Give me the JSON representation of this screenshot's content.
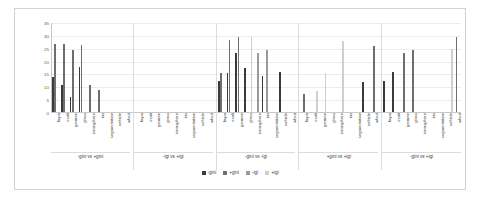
{
  "chart_data": {
    "type": "bar",
    "title": "",
    "subtitle": "",
    "xlabel": "",
    "ylabel": "",
    "ylim": [
      0,
      35
    ],
    "yticks": [
      0,
      5,
      10,
      15,
      20,
      25,
      30,
      35
    ],
    "grid": true,
    "legend_position": "bottom",
    "legend": [
      "-gini",
      "+gini",
      "-igi",
      "+igi"
    ],
    "colors": {
      "-gini": "#3a3a3a",
      "+gini": "#6e6e6e",
      "-igi": "#9a9a9a",
      "+igi": "#cfcfcf"
    },
    "group_labels": [
      "-gini vs +gini",
      "-igi vs +igi",
      "-gini vs -igi",
      "+gini vs +igi",
      "-gini vs +igi"
    ],
    "datasets": [
      "bupa",
      "ecoli",
      "german",
      "glass",
      "ionosphere",
      "iris",
      "segmentation",
      "vehicle",
      "wbcd"
    ],
    "categories": [
      "bupa",
      "ecoli",
      "german",
      "glass",
      "ionosphere",
      "iris",
      "segmentation",
      "vehicle",
      "wbcd",
      "bupa",
      "ecoli",
      "german",
      "glass",
      "ionosphere",
      "iris",
      "segmentation",
      "vehicle",
      "wbcd",
      "bupa",
      "ecoli",
      "german",
      "glass",
      "ionosphere",
      "iris",
      "segmentation",
      "vehicle",
      "wbcd",
      "bupa",
      "ecoli",
      "german",
      "glass",
      "ionosphere",
      "iris",
      "segmentation",
      "vehicle",
      "wbcd",
      "bupa",
      "ecoli",
      "german",
      "glass",
      "ionosphere",
      "iris",
      "segmentation",
      "vehicle",
      "wbcd"
    ],
    "series": [
      {
        "name": "-gini",
        "values": [
          13.5,
          10.5,
          6.0,
          17.5,
          0,
          0,
          0,
          0,
          0,
          0,
          0,
          0,
          0,
          0,
          0,
          0,
          0,
          0,
          12.0,
          15.0,
          23.0,
          17.0,
          0,
          14.0,
          0,
          15.5,
          0,
          0,
          0,
          0,
          0,
          0,
          0,
          0,
          11.5,
          0,
          12.0,
          15.5,
          0,
          0,
          0,
          0,
          0,
          0,
          0
        ]
      },
      {
        "name": "+gini",
        "values": [
          26.5,
          26.5,
          24.0,
          26.0,
          10.5,
          8.5,
          0,
          0,
          0,
          0,
          0,
          0,
          0,
          0,
          0,
          0,
          0,
          0,
          15.0,
          28.0,
          29.0,
          0,
          0,
          0,
          0,
          0,
          0,
          7.0,
          0,
          0,
          0,
          0,
          0,
          0,
          0,
          25.5,
          0,
          0,
          23.0,
          24.0,
          0,
          0,
          0,
          0,
          29.0
        ]
      },
      {
        "name": "-igi",
        "values": [
          0,
          0,
          0,
          0,
          0,
          0,
          0,
          0,
          0,
          0,
          0,
          0,
          0,
          0,
          0,
          0,
          0,
          0,
          0,
          0,
          0,
          0,
          23.0,
          24.0,
          0,
          0,
          0,
          0,
          0,
          0,
          0,
          0,
          0,
          0,
          0,
          0,
          0,
          0,
          0,
          0,
          0,
          0,
          0,
          0,
          0
        ]
      },
      {
        "name": "+igi",
        "values": [
          0,
          0,
          0,
          0,
          0,
          0,
          0,
          0,
          0,
          0,
          0,
          0,
          0,
          0,
          0,
          0,
          0,
          0,
          0,
          0,
          0,
          29.0,
          0,
          0,
          0,
          0,
          0,
          0,
          8.0,
          15.0,
          0,
          27.5,
          0,
          0,
          0,
          0,
          0,
          0,
          0,
          0,
          0,
          0,
          0,
          24.5,
          0
        ]
      }
    ],
    "bars": [
      {
        "group": 0,
        "dataset": "bupa",
        "series": "-gini",
        "value": 13.5
      },
      {
        "group": 0,
        "dataset": "bupa",
        "series": "+gini",
        "value": 26.5
      },
      {
        "group": 0,
        "dataset": "ecoli",
        "series": "-gini",
        "value": 10.5
      },
      {
        "group": 0,
        "dataset": "ecoli",
        "series": "+gini",
        "value": 26.5
      },
      {
        "group": 0,
        "dataset": "german",
        "series": "-gini",
        "value": 6.0
      },
      {
        "group": 0,
        "dataset": "german",
        "series": "+gini",
        "value": 24.0
      },
      {
        "group": 0,
        "dataset": "glass",
        "series": "-gini",
        "value": 17.5
      },
      {
        "group": 0,
        "dataset": "glass",
        "series": "+gini",
        "value": 26.0
      },
      {
        "group": 0,
        "dataset": "ionosphere",
        "series": "-igi",
        "value": 10.5
      },
      {
        "group": 0,
        "dataset": "iris",
        "series": "-igi",
        "value": 8.5
      },
      {
        "group": 0,
        "dataset": "segmentation",
        "series": "+gini",
        "value": 15.0
      },
      {
        "group": 0,
        "dataset": "vehicle",
        "series": "-gini",
        "value": 12.0
      },
      {
        "group": 0,
        "dataset": "wbcd",
        "series": "+gini",
        "value": 28.0
      }
    ],
    "bar_values_ordered": [
      26.5,
      13.5,
      26.5,
      10.5,
      24.0,
      6.0,
      26.0,
      17.5,
      10.5,
      8.5,
      15.0,
      12.0,
      28.0,
      15.0,
      29.0,
      23.0,
      17.0,
      29.0,
      23.0,
      14.0,
      24.0,
      15.5,
      7.0,
      8.0,
      15.0,
      6.0,
      15.0,
      27.5,
      11.5,
      25.5,
      12.0,
      23.0,
      15.5,
      24.0,
      12.0,
      24.5,
      29.0
    ]
  },
  "axis": {
    "y_max_label": "35",
    "y_min_label": "0"
  }
}
